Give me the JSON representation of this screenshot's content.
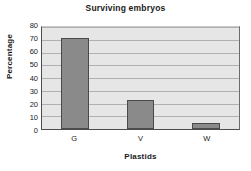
{
  "chart_data": {
    "type": "bar",
    "title": "Surviving embryos",
    "xlabel": "Plastids",
    "ylabel": "Percentage",
    "categories": [
      "G",
      "V",
      "W"
    ],
    "values": [
      71,
      23,
      5
    ],
    "ylim": [
      0,
      80
    ],
    "ytick_labels": [
      "80",
      "70",
      "60",
      "50",
      "40",
      "30",
      "20",
      "10",
      "0"
    ],
    "ytick_values": [
      80,
      70,
      60,
      50,
      40,
      30,
      20,
      10,
      0
    ],
    "ytick_step": 10,
    "grid": true,
    "legend": false,
    "legend_position": "none",
    "series": [
      {
        "name": "Surviving embryos",
        "values": [
          71,
          23,
          5
        ]
      }
    ],
    "colors": {
      "bar_fill": "#8a8a8a",
      "bar_border": "#4a4a4a",
      "plot_background": "#e6e6e6",
      "gridline": "#b0b0b0",
      "axis": "#4d4d4d",
      "text": "#1a1a1a",
      "figure_background": "#ffffff"
    }
  }
}
